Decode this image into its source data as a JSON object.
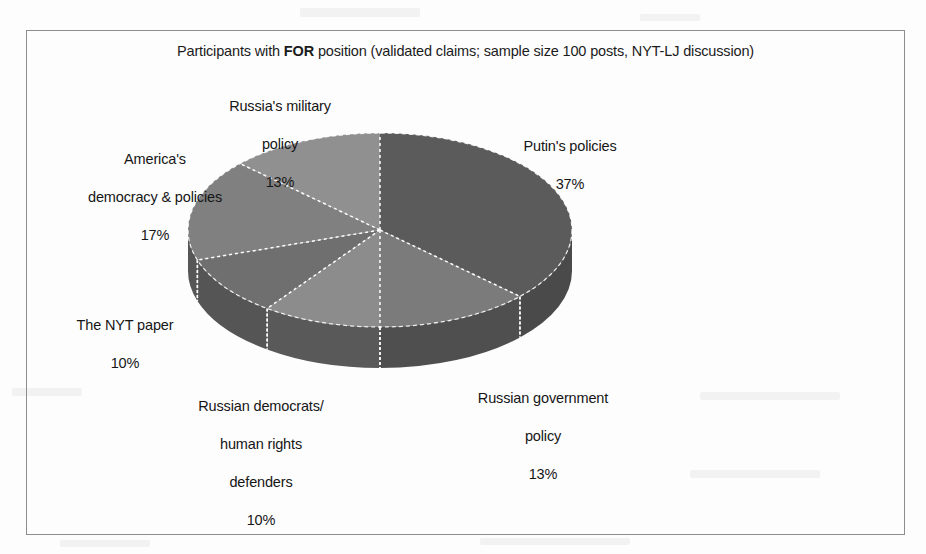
{
  "page": {
    "background_color": "#fdfdfd",
    "frame_border_color": "#8d8d8d"
  },
  "chart_data": {
    "type": "pie",
    "title": "Participants with FOR position (validated claims; sample size 100 posts, NYT-LJ discussion)",
    "title_parts": {
      "before": "Participants with ",
      "emphasis": "FOR",
      "after": " position (validated claims; sample size 100 posts, NYT-LJ discussion)"
    },
    "xlabel": "",
    "ylabel": "",
    "legend": "none",
    "grid": false,
    "three_d": true,
    "start_angle_deg": 0,
    "direction": "clockwise",
    "categories": [
      "Putin's policies",
      "Russian government policy",
      "Russian democrats/ human rights defenders",
      "The NYT paper",
      "America's democracy & policies",
      "Russia's military policy"
    ],
    "values": [
      37,
      13,
      10,
      10,
      17,
      13
    ],
    "units": "%",
    "slices": [
      {
        "label": "Putin's policies",
        "label_lines": [
          "Putin's policies"
        ],
        "value": 37,
        "value_text": "37%",
        "top_color": "#5b5b5b",
        "side_color": "#4a4a4a"
      },
      {
        "label": "Russian government policy",
        "label_lines": [
          "Russian government",
          "policy"
        ],
        "value": 13,
        "value_text": "13%",
        "top_color": "#7b7b7b",
        "side_color": "#4f4f4f"
      },
      {
        "label": "Russian democrats/ human rights defenders",
        "label_lines": [
          "Russian democrats/",
          "human rights",
          "defenders"
        ],
        "value": 10,
        "value_text": "10%",
        "top_color": "#8c8c8c",
        "side_color": "#595959"
      },
      {
        "label": "The NYT paper",
        "label_lines": [
          "The NYT paper"
        ],
        "value": 10,
        "value_text": "10%",
        "top_color": "#6f6f6f",
        "side_color": "#555555"
      },
      {
        "label": "America's democracy & policies",
        "label_lines": [
          "America's",
          "democracy & policies"
        ],
        "value": 17,
        "value_text": "17%",
        "top_color": "#808080",
        "side_color": "#565656"
      },
      {
        "label": "Russia's military policy",
        "label_lines": [
          "Russia's military",
          "policy"
        ],
        "value": 13,
        "value_text": "13%",
        "top_color": "#909090",
        "side_color": "#5c5c5c"
      }
    ],
    "geometry": {
      "center_x": 380,
      "center_y": 230,
      "radius_x": 192,
      "radius_y": 97,
      "depth": 41
    },
    "separator_color": "#ffffff",
    "separator_style": "dotted"
  },
  "labels": {
    "putin": {
      "name": "Putin's policies",
      "pct": "37%"
    },
    "gov": {
      "name_line1": "Russian government",
      "name_line2": "policy",
      "pct": "13%"
    },
    "democrats": {
      "name_line1": "Russian democrats/",
      "name_line2": "human rights",
      "name_line3": "defenders",
      "pct": "10%"
    },
    "nyt": {
      "name": "The NYT paper",
      "pct": "10%"
    },
    "america": {
      "name_line1": "America's",
      "name_line2": "democracy & policies",
      "pct": "17%"
    },
    "military": {
      "name_line1": "Russia's military",
      "name_line2": "policy",
      "pct": "13%"
    }
  }
}
